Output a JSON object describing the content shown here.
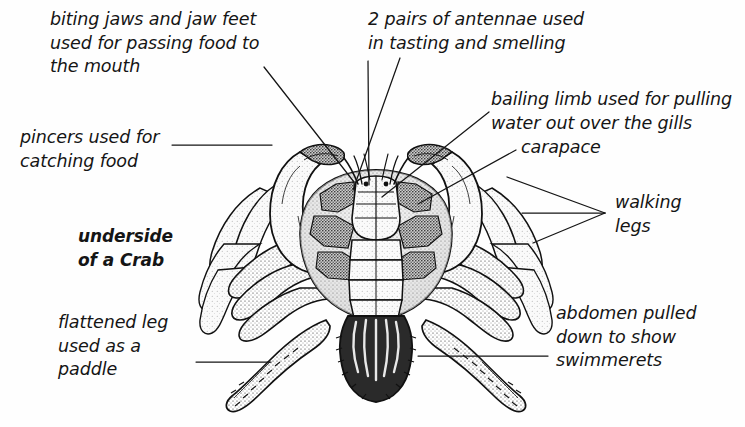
{
  "figure": {
    "title": "underside\nof a Crab",
    "background_color": "#fefefe",
    "ink_color": "#151515"
  },
  "labels": [
    {
      "id": "biting-jaws",
      "text": "biting jaws and jaw feet\nused for passing food to\nthe mouth",
      "align": "left"
    },
    {
      "id": "antennae",
      "text": "2 pairs of antennae used\nin tasting and smelling",
      "align": "left"
    },
    {
      "id": "pincers",
      "text": "pincers used for\ncatching food",
      "align": "left"
    },
    {
      "id": "bailing-limb",
      "text": "bailing limb used for pulling\nwater out over the gills",
      "align": "left"
    },
    {
      "id": "carapace",
      "text": "carapace",
      "align": "left"
    },
    {
      "id": "walking-legs",
      "text": "walking\nlegs",
      "align": "left"
    },
    {
      "id": "underside-title",
      "text": "underside\nof a Crab",
      "align": "left",
      "bold": true
    },
    {
      "id": "flattened-leg",
      "text": "flattened leg\nused as a\npaddle",
      "align": "left"
    },
    {
      "id": "abdomen",
      "text": "abdomen pulled\ndown to show\nswimmerets",
      "align": "left"
    }
  ],
  "leader_lines": [
    {
      "id": "leader-biting-jaws",
      "from": [
        264,
        67
      ],
      "to": [
        354,
        182
      ]
    },
    {
      "id": "leader-antennae-1",
      "from": [
        368,
        61
      ],
      "to": [
        369,
        185
      ]
    },
    {
      "id": "leader-antennae-2",
      "from": [
        400,
        58
      ],
      "to": [
        353,
        190
      ]
    },
    {
      "id": "leader-pincers",
      "from": [
        172,
        145
      ],
      "to": [
        272,
        145
      ]
    },
    {
      "id": "leader-bailing-limb",
      "from": [
        489,
        112
      ],
      "to": [
        382,
        197
      ]
    },
    {
      "id": "leader-carapace",
      "from": [
        516,
        150
      ],
      "to": [
        418,
        204
      ]
    },
    {
      "id": "leader-walking-1",
      "from": [
        605,
        213
      ],
      "to": [
        507,
        177
      ]
    },
    {
      "id": "leader-walking-2",
      "from": [
        605,
        213
      ],
      "to": [
        522,
        213
      ]
    },
    {
      "id": "leader-walking-3",
      "from": [
        605,
        213
      ],
      "to": [
        533,
        243
      ]
    },
    {
      "id": "leader-flattened",
      "from": [
        196,
        362
      ],
      "to": [
        271,
        362
      ]
    },
    {
      "id": "leader-abdomen",
      "from": [
        548,
        356
      ],
      "to": [
        418,
        356
      ]
    }
  ]
}
